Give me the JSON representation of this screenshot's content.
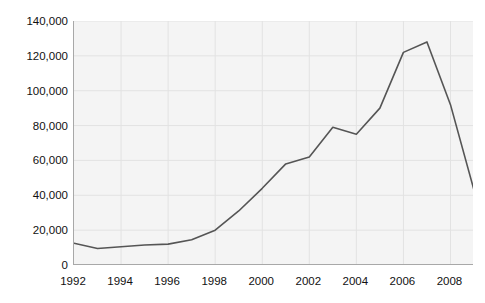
{
  "chart_data": {
    "type": "line",
    "title": "",
    "xlabel": "",
    "ylabel": "",
    "x": [
      1992,
      1993,
      1994,
      1995,
      1996,
      1997,
      1998,
      1999,
      2000,
      2001,
      2002,
      2003,
      2004,
      2005,
      2006,
      2007,
      2008,
      2009
    ],
    "values": [
      12500,
      9500,
      10500,
      11500,
      12000,
      14500,
      20000,
      31000,
      44000,
      58000,
      62000,
      79000,
      75000,
      90000,
      122000,
      128000,
      92000,
      43000
    ],
    "series": [
      {
        "name": "series-1",
        "color": "#555555",
        "values": [
          12500,
          9500,
          10500,
          11500,
          12000,
          14500,
          20000,
          31000,
          44000,
          58000,
          62000,
          79000,
          75000,
          90000,
          122000,
          128000,
          92000,
          43000
        ]
      }
    ],
    "xlim": [
      1992,
      2009
    ],
    "ylim": [
      0,
      140000
    ],
    "y_ticks": [
      0,
      20000,
      40000,
      60000,
      80000,
      100000,
      120000,
      140000
    ],
    "y_tick_labels": [
      "0",
      "20,000",
      "40,000",
      "60,000",
      "80,000",
      "100,000",
      "120,000",
      "140,000"
    ],
    "x_ticks": [
      1992,
      1994,
      1996,
      1998,
      2000,
      2002,
      2004,
      2006,
      2008
    ],
    "x_tick_labels": [
      "1992",
      "1994",
      "1996",
      "1998",
      "2000",
      "2002",
      "2004",
      "2006",
      "2008"
    ],
    "grid": true,
    "grid_color": "#e2e2e2",
    "plot_background": "#f4f4f4",
    "axis_color": "#a8a8a8",
    "legend": null,
    "legend_position": "none",
    "markers": false
  }
}
